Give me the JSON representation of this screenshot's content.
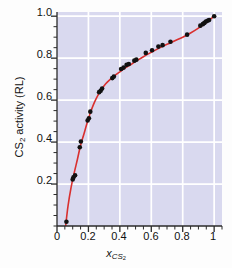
{
  "chart_data": {
    "type": "scatter",
    "title": "",
    "subtitle": "",
    "xlabel": "x_CS2",
    "xlabel_base": "x",
    "xlabel_sub": "CS",
    "xlabel_sub2": "2",
    "ylabel": "CS2 activity (RL)",
    "ylabel_base": "CS",
    "ylabel_sub": "2",
    "ylabel_rest": " activity (RL)",
    "xlim": [
      0.0,
      1.05
    ],
    "ylim": [
      0.0,
      1.02
    ],
    "xticks": [
      0,
      0.2,
      0.4,
      0.6,
      0.8,
      1
    ],
    "xtick_labels": [
      "0",
      "0.2",
      "0.4",
      "0.6",
      "0.8",
      "1"
    ],
    "yticks": [
      0.2,
      0.4,
      0.6,
      0.8,
      1.0
    ],
    "ytick_labels": [
      "0.2",
      "0.4",
      "0.6",
      "0.8",
      "1.0"
    ],
    "minor_tick_step": 0.05,
    "grid": true,
    "grid_color": "#ffffff",
    "plot_background": "#d9d9ef",
    "legend": "none",
    "series": [
      {
        "name": "CS2 activity data",
        "marker": "filled-circle",
        "marker_color": "#111111",
        "marker_size": 4.6,
        "x": [
          0.06,
          0.1,
          0.105,
          0.115,
          0.145,
          0.152,
          0.195,
          0.203,
          0.212,
          0.268,
          0.278,
          0.287,
          0.352,
          0.362,
          0.408,
          0.424,
          0.443,
          0.457,
          0.492,
          0.505,
          0.565,
          0.605,
          0.645,
          0.672,
          0.722,
          0.828,
          0.912,
          0.928,
          0.938,
          0.948,
          0.958,
          0.968,
          1.0
        ],
        "y": [
          0.02,
          0.222,
          0.232,
          0.242,
          0.375,
          0.403,
          0.503,
          0.513,
          0.545,
          0.638,
          0.645,
          0.655,
          0.705,
          0.712,
          0.748,
          0.755,
          0.768,
          0.772,
          0.788,
          0.793,
          0.825,
          0.838,
          0.855,
          0.862,
          0.878,
          0.912,
          0.955,
          0.962,
          0.968,
          0.975,
          0.978,
          0.982,
          1.0
        ]
      },
      {
        "name": "fit curve",
        "marker": "none",
        "line_color": "#d9302f",
        "line_width": 1.6,
        "x": [
          0.055,
          0.07,
          0.09,
          0.11,
          0.13,
          0.15,
          0.17,
          0.19,
          0.21,
          0.23,
          0.25,
          0.27,
          0.29,
          0.31,
          0.33,
          0.35,
          0.37,
          0.4,
          0.43,
          0.46,
          0.5,
          0.55,
          0.6,
          0.65,
          0.7,
          0.75,
          0.8,
          0.85,
          0.9,
          0.95,
          1.0
        ],
        "y": [
          0.0,
          0.095,
          0.185,
          0.255,
          0.318,
          0.385,
          0.435,
          0.487,
          0.535,
          0.575,
          0.608,
          0.636,
          0.659,
          0.678,
          0.693,
          0.706,
          0.718,
          0.735,
          0.752,
          0.765,
          0.784,
          0.807,
          0.828,
          0.848,
          0.866,
          0.883,
          0.9,
          0.92,
          0.943,
          0.97,
          1.0
        ]
      }
    ]
  }
}
